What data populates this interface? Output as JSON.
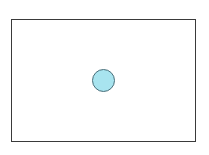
{
  "diagram": {
    "frame": {
      "stroke": "#3a3a3a",
      "fill": "#ffffff"
    },
    "circle": {
      "fill": "#a8e4ef",
      "stroke": "#4a6f7a",
      "cx": 103,
      "cy": 80,
      "r": 11
    }
  }
}
